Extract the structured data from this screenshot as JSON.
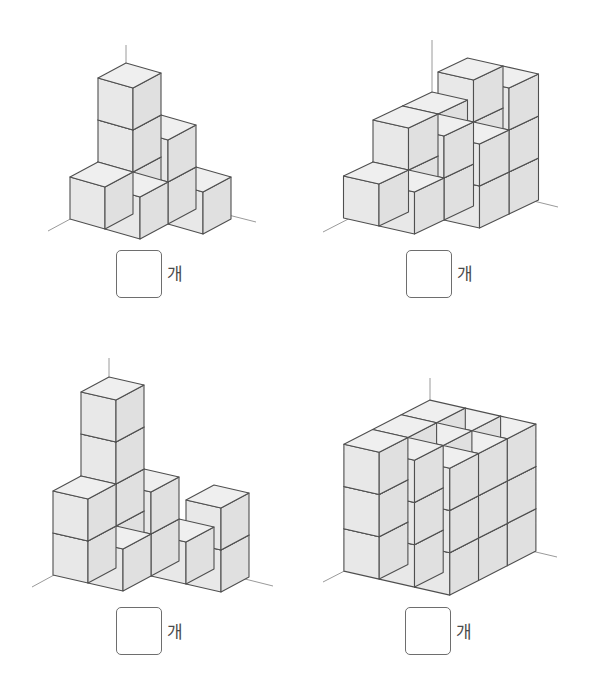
{
  "problems": [
    {
      "id": "problem-1",
      "unit_label": "개",
      "answer_value": "",
      "box": {
        "left": 116,
        "top": 250
      },
      "label": {
        "left": 167,
        "top": 266
      },
      "figure": {
        "origin": [
          126,
          189
        ],
        "x_vec": [
          35,
          10
        ],
        "d_vec": [
          -28,
          15
        ],
        "v_vec": [
          0,
          -42
        ],
        "heights": [
          [
            3,
            1
          ],
          [
            2,
            1
          ],
          [
            1,
            0
          ]
        ],
        "axis": {
          "top": [
            126,
            45
          ],
          "left_end": [
            48,
            231
          ],
          "right_end": [
            256,
            222
          ]
        }
      }
    },
    {
      "id": "problem-2",
      "unit_label": "개",
      "answer_value": "",
      "box": {
        "left": 406,
        "top": 250
      },
      "label": {
        "left": 457,
        "top": 266
      },
      "figure": {
        "origin": [
          432,
          176
        ],
        "x_vec": [
          35.5,
          8
        ],
        "d_vec": [
          -29.5,
          14
        ],
        "v_vec": [
          0,
          -42
        ],
        "heights": [
          [
            2,
            2,
            1
          ],
          [
            3,
            2,
            1
          ],
          [
            3,
            2,
            0
          ]
        ],
        "axis": {
          "top": [
            432,
            40
          ],
          "left_end": [
            323,
            232
          ],
          "right_end": [
            558,
            207
          ]
        }
      }
    },
    {
      "id": "problem-3",
      "unit_label": "개",
      "answer_value": "",
      "box": {
        "left": 116,
        "top": 607
      },
      "label": {
        "left": 167,
        "top": 624
      },
      "figure": {
        "origin": [
          109,
          545
        ],
        "x_vec": [
          35,
          8
        ],
        "d_vec": [
          -28,
          15
        ],
        "v_vec": [
          0,
          -42
        ],
        "heights": [
          [
            4,
            2
          ],
          [
            2,
            1
          ],
          [
            1,
            0
          ],
          [
            2,
            0
          ]
        ],
        "axis": {
          "top": [
            109,
            358
          ],
          "left_end": [
            32,
            587
          ],
          "right_end": [
            273,
            586
          ]
        }
      }
    },
    {
      "id": "problem-4",
      "unit_label": "개",
      "answer_value": "",
      "box": {
        "left": 405,
        "top": 607
      },
      "label": {
        "left": 456,
        "top": 624
      },
      "figure": {
        "origin": [
          430,
          527
        ],
        "x_vec": [
          35.3,
          8
        ],
        "d_vec": [
          -28.7,
          14.7
        ],
        "v_vec": [
          0,
          -42.3
        ],
        "heights": [
          [
            3,
            3,
            3
          ],
          [
            3,
            3,
            3
          ],
          [
            3,
            3,
            3
          ]
        ],
        "axis": {
          "top": [
            430,
            378
          ],
          "left_end": [
            323,
            582
          ],
          "right_end": [
            557,
            557
          ]
        }
      }
    }
  ],
  "colors": {
    "top_face": "#efefef",
    "front_face": "#e8e8e8",
    "side_face": "#e0e0e0",
    "edge": "#4f4f4f",
    "axis": "#9a9a9a"
  }
}
